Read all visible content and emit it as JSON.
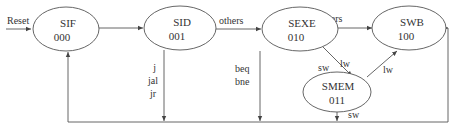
{
  "diagram": {
    "type": "state-machine",
    "reset_label": "Reset",
    "states": [
      {
        "id": "SIF",
        "name": "SIF",
        "code": "000"
      },
      {
        "id": "SID",
        "name": "SID",
        "code": "001"
      },
      {
        "id": "SEXE",
        "name": "SEXE",
        "code": "010"
      },
      {
        "id": "SMEM",
        "name": "SMEM",
        "code": "011"
      },
      {
        "id": "SWB",
        "name": "SWB",
        "code": "100"
      }
    ],
    "transitions": [
      {
        "from": "SIF",
        "to": "SID",
        "label": ""
      },
      {
        "from": "SID",
        "to": "SEXE",
        "label": "others"
      },
      {
        "from": "SID",
        "to": "SIF",
        "label_lines": [
          "j",
          "jal",
          "jr"
        ]
      },
      {
        "from": "SEXE",
        "to": "SWB",
        "label": "others"
      },
      {
        "from": "SEXE",
        "to": "SIF",
        "label_lines": [
          "beq",
          "bne"
        ]
      },
      {
        "from": "SEXE",
        "to": "SMEM",
        "label": "sw",
        "label2": "lw"
      },
      {
        "from": "SMEM",
        "to": "SWB",
        "label": "lw"
      },
      {
        "from": "SMEM",
        "to": "SIF",
        "label": "sw"
      },
      {
        "from": "SWB",
        "to": "SIF",
        "label": ""
      }
    ]
  }
}
